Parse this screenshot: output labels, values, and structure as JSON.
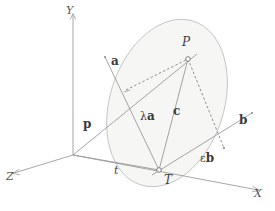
{
  "figure": {
    "background_color": "#ffffff",
    "width": 275,
    "height": 211,
    "colors": {
      "axis": "#9a9a9a",
      "solid_line": "#8f8f8f",
      "dashed_line": "#6e6e6e",
      "ellipse": "#b9b9b9",
      "plane_fill": "#f4f4f2",
      "label": "#3f3f3f"
    }
  },
  "axes": [
    {
      "id": "y",
      "label": "Y",
      "label_x": 66,
      "label_y": 5
    },
    {
      "id": "z",
      "label": "Z",
      "label_x": 6,
      "label_y": 171
    },
    {
      "id": "x",
      "label": "X",
      "label_x": 254,
      "label_y": 188
    }
  ],
  "points": [
    {
      "id": "P",
      "label": "P",
      "label_x": 182,
      "label_y": 36,
      "marker_x": 188,
      "marker_y": 59
    },
    {
      "id": "T",
      "label": "T",
      "label_x": 164,
      "label_y": 174,
      "marker_x": 159,
      "marker_y": 170
    }
  ],
  "vectors": [
    {
      "id": "a",
      "label": "a",
      "bold": true,
      "label_x": 111,
      "label_y": 55
    },
    {
      "id": "b",
      "label": "b",
      "bold": true,
      "label_x": 239,
      "label_y": 114
    },
    {
      "id": "c",
      "label": "c",
      "bold": true,
      "label_x": 173,
      "label_y": 105
    },
    {
      "id": "p",
      "label": "p",
      "bold": true,
      "label_x": 83,
      "label_y": 118
    }
  ],
  "scaled_vectors": [
    {
      "id": "lambda-a",
      "scalar": "λ",
      "vector": "a",
      "label_x": 140,
      "label_y": 110
    },
    {
      "id": "epsilon-b",
      "scalar": "ε",
      "vector": "b",
      "label_x": 200,
      "label_y": 152
    }
  ],
  "parameters": [
    {
      "id": "t",
      "label": "t",
      "label_x": 114,
      "label_y": 165
    }
  ]
}
